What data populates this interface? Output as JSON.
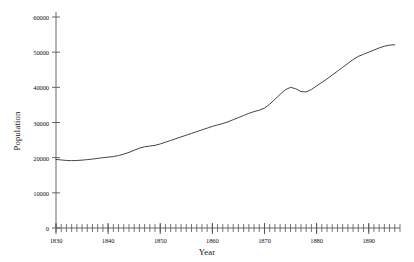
{
  "chart_data": {
    "type": "line",
    "title": "",
    "subtitle": "",
    "xlabel": "Year",
    "ylabel": "Population",
    "xlim": [
      1830,
      1896
    ],
    "ylim": [
      0,
      60000
    ],
    "grid": false,
    "legend": null,
    "legend_position": "none",
    "y_ticks": [
      0,
      10000,
      20000,
      30000,
      40000,
      50000,
      60000
    ],
    "y_tick_labels": [
      "0",
      "10000",
      "20000",
      "30000",
      "40000",
      "50000",
      "60000"
    ],
    "x_ticks": [
      1830,
      1840,
      1850,
      1860,
      1870,
      1880,
      1890
    ],
    "x_tick_labels": [
      "1830",
      "1840",
      "1850",
      "1860",
      "1870",
      "1880",
      "1890"
    ],
    "x_minor_tick_interval": 1,
    "line_color": "#444444",
    "line_width": 1,
    "series": [
      {
        "name": "Population",
        "x": [
          1830,
          1831,
          1832,
          1833,
          1834,
          1835,
          1836,
          1837,
          1838,
          1839,
          1840,
          1841,
          1842,
          1843,
          1844,
          1845,
          1846,
          1847,
          1848,
          1849,
          1850,
          1851,
          1852,
          1853,
          1854,
          1855,
          1856,
          1857,
          1858,
          1859,
          1860,
          1861,
          1862,
          1863,
          1864,
          1865,
          1866,
          1867,
          1868,
          1869,
          1870,
          1871,
          1872,
          1873,
          1874,
          1875,
          1876,
          1877,
          1878,
          1879,
          1880,
          1881,
          1882,
          1883,
          1884,
          1885,
          1886,
          1887,
          1888,
          1889,
          1890,
          1891,
          1892,
          1893,
          1894,
          1895
        ],
        "values": [
          19500,
          19350,
          19200,
          19150,
          19200,
          19300,
          19450,
          19600,
          19800,
          20000,
          20150,
          20300,
          20600,
          21000,
          21500,
          22100,
          22700,
          23100,
          23300,
          23500,
          23900,
          24400,
          24900,
          25400,
          25900,
          26400,
          26900,
          27400,
          27900,
          28400,
          28900,
          29300,
          29700,
          30200,
          30800,
          31400,
          32000,
          32600,
          33100,
          33500,
          34100,
          35200,
          36600,
          38000,
          39300,
          40000,
          39600,
          38800,
          38700,
          39400,
          40400,
          41400,
          42400,
          43500,
          44600,
          45700,
          46800,
          47900,
          48800,
          49400,
          50000,
          50600,
          51200,
          51700,
          52000,
          52100
        ]
      }
    ]
  }
}
